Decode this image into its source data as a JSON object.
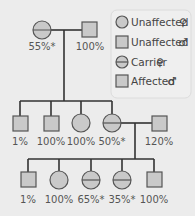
{
  "legend": {
    "items": [
      {
        "symbol": "circle",
        "label": "Unaffected",
        "sex_symbol": "♀"
      },
      {
        "symbol": "square",
        "label": "Unaffected",
        "sex_symbol": "♂"
      },
      {
        "symbol": "carrier-circle",
        "label": "Carrier",
        "sex_symbol": "♀"
      },
      {
        "symbol": "square",
        "label": "Affected",
        "sex_symbol": "♂"
      }
    ]
  },
  "pedigree": {
    "generation1": [
      {
        "sex": "female",
        "type": "unaffected",
        "label": "55%*"
      },
      {
        "sex": "male",
        "type": "unaffected",
        "label": "100%"
      }
    ],
    "generation2": [
      {
        "sex": "male",
        "type": "unaffected",
        "label": "1%"
      },
      {
        "sex": "male",
        "type": "unaffected",
        "label": "100%"
      },
      {
        "sex": "female",
        "type": "unaffected",
        "label": "100%"
      },
      {
        "sex": "female",
        "type": "carrier",
        "label": "50%*"
      }
    ],
    "generation2_spouse": {
      "sex": "male",
      "type": "unaffected",
      "label": "120%"
    },
    "generation3": [
      {
        "sex": "male",
        "type": "unaffected",
        "label": "1%"
      },
      {
        "sex": "female",
        "type": "unaffected",
        "label": "100%"
      },
      {
        "sex": "female",
        "type": "carrier",
        "label": "65%*"
      },
      {
        "sex": "female",
        "type": "carrier",
        "label": "35%*"
      },
      {
        "sex": "male",
        "type": "unaffected",
        "label": "100%"
      }
    ]
  },
  "colors": {
    "fill": "#c9c9c9",
    "stroke": "#555555",
    "line": "#333333",
    "background": "#ececec"
  }
}
